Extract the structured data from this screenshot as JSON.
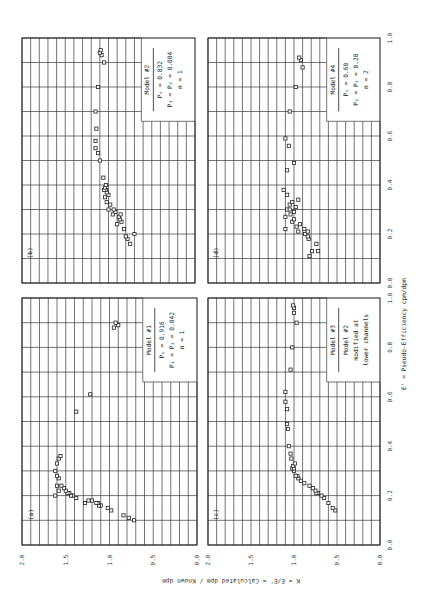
{
  "chart_data": [
    {
      "type": "scatter",
      "panel": "(a)",
      "xlabel": "E' = Pseudo-Efficiency cpm/dpm",
      "ylabel": "K = E/E' = Calculated dpm / Known dpm",
      "xlim": [
        0.0,
        1.0
      ],
      "ylim": [
        0.0,
        2.0
      ],
      "xticks": [
        "0.0",
        "0.2",
        "0.4",
        "0.6",
        "0.8",
        "1.0"
      ],
      "yticks": [
        "0.0",
        "0.5",
        "1.0",
        "1.5",
        "2.0"
      ],
      "grid": true,
      "legend": {
        "title": "Model #1",
        "lines": [
          "P_s = 0.916",
          "P_1 = P_2 = 0.042",
          "n = 1"
        ]
      },
      "points": [
        [
          0.1,
          0.72
        ],
        [
          0.11,
          0.78
        ],
        [
          0.12,
          0.84
        ],
        [
          0.14,
          0.98
        ],
        [
          0.15,
          1.02
        ],
        [
          0.16,
          1.1
        ],
        [
          0.16,
          1.12
        ],
        [
          0.17,
          1.13
        ],
        [
          0.17,
          1.15
        ],
        [
          0.18,
          1.2
        ],
        [
          0.18,
          1.24
        ],
        [
          0.17,
          1.28
        ],
        [
          0.19,
          1.38
        ],
        [
          0.2,
          1.42
        ],
        [
          0.2,
          1.44
        ],
        [
          0.21,
          1.46
        ],
        [
          0.21,
          1.48
        ],
        [
          0.22,
          1.5
        ],
        [
          0.23,
          1.52
        ],
        [
          0.24,
          1.55
        ],
        [
          0.22,
          1.58
        ],
        [
          0.24,
          1.6
        ],
        [
          0.2,
          1.62
        ],
        [
          0.27,
          1.58
        ],
        [
          0.28,
          1.6
        ],
        [
          0.3,
          1.62
        ],
        [
          0.33,
          1.6
        ],
        [
          0.35,
          1.58
        ],
        [
          0.36,
          1.56
        ],
        [
          0.54,
          1.38
        ],
        [
          0.61,
          1.22
        ],
        [
          0.88,
          0.95
        ],
        [
          0.89,
          0.9
        ],
        [
          0.9,
          0.93
        ]
      ]
    },
    {
      "type": "scatter",
      "panel": "(b)",
      "xlim": [
        0.0,
        1.0
      ],
      "ylim": [
        0.0,
        2.0
      ],
      "grid": true,
      "legend": {
        "title": "Model #2",
        "lines": [
          "P_s = 0.832",
          "P_1 = P_2 = 0.084",
          "n = 1"
        ]
      },
      "points": [
        [
          0.16,
          0.75
        ],
        [
          0.18,
          0.78
        ],
        [
          0.19,
          0.8
        ],
        [
          0.2,
          0.7
        ],
        [
          0.22,
          0.82
        ],
        [
          0.24,
          0.9
        ],
        [
          0.25,
          0.85
        ],
        [
          0.26,
          0.87
        ],
        [
          0.27,
          0.88
        ],
        [
          0.28,
          0.86
        ],
        [
          0.28,
          0.95
        ],
        [
          0.29,
          0.92
        ],
        [
          0.3,
          0.94
        ],
        [
          0.3,
          1.0
        ],
        [
          0.32,
          0.98
        ],
        [
          0.33,
          1.02
        ],
        [
          0.35,
          1.04
        ],
        [
          0.36,
          1.0
        ],
        [
          0.37,
          1.02
        ],
        [
          0.38,
          1.03
        ],
        [
          0.38,
          1.05
        ],
        [
          0.39,
          1.04
        ],
        [
          0.4,
          1.03
        ],
        [
          0.43,
          1.06
        ],
        [
          0.5,
          1.1
        ],
        [
          0.53,
          1.12
        ],
        [
          0.55,
          1.15
        ],
        [
          0.58,
          1.15
        ],
        [
          0.63,
          1.14
        ],
        [
          0.7,
          1.15
        ],
        [
          0.8,
          1.12
        ],
        [
          0.9,
          1.05
        ],
        [
          0.93,
          1.08
        ],
        [
          0.94,
          1.1
        ],
        [
          0.95,
          1.09
        ]
      ]
    },
    {
      "type": "scatter",
      "panel": "(c)",
      "xlim": [
        0.0,
        1.0
      ],
      "ylim": [
        0.0,
        2.0
      ],
      "grid": true,
      "legend": {
        "title": "Model #3",
        "lines": [
          "Model #2",
          "modified at",
          "lower channels"
        ]
      },
      "points": [
        [
          0.14,
          0.52
        ],
        [
          0.15,
          0.55
        ],
        [
          0.17,
          0.6
        ],
        [
          0.19,
          0.65
        ],
        [
          0.2,
          0.68
        ],
        [
          0.21,
          0.72
        ],
        [
          0.21,
          0.74
        ],
        [
          0.22,
          0.75
        ],
        [
          0.23,
          0.78
        ],
        [
          0.24,
          0.82
        ],
        [
          0.25,
          0.88
        ],
        [
          0.26,
          0.92
        ],
        [
          0.27,
          0.95
        ],
        [
          0.28,
          0.96
        ],
        [
          0.28,
          0.98
        ],
        [
          0.3,
          1.0
        ],
        [
          0.31,
          1.02
        ],
        [
          0.31,
          1.0
        ],
        [
          0.32,
          1.01
        ],
        [
          0.33,
          0.99
        ],
        [
          0.35,
          1.03
        ],
        [
          0.37,
          1.04
        ],
        [
          0.4,
          1.06
        ],
        [
          0.47,
          1.07
        ],
        [
          0.49,
          1.08
        ],
        [
          0.55,
          1.08
        ],
        [
          0.58,
          1.1
        ],
        [
          0.62,
          1.1
        ],
        [
          0.71,
          1.04
        ],
        [
          0.8,
          1.02
        ],
        [
          0.9,
          0.97
        ],
        [
          0.94,
          1.0
        ],
        [
          0.96,
          1.0
        ],
        [
          0.97,
          1.01
        ]
      ]
    },
    {
      "type": "scatter",
      "panel": "(d)",
      "xlim": [
        0.0,
        1.0
      ],
      "ylim": [
        0.0,
        2.0
      ],
      "grid": true,
      "legend": {
        "title": "Model #4",
        "lines": [
          "P_s = 0.60",
          "P_1 = P_2 = 0.20",
          "n = 2"
        ]
      },
      "points": [
        [
          0.11,
          0.82
        ],
        [
          0.13,
          0.79
        ],
        [
          0.13,
          0.72
        ],
        [
          0.16,
          0.74
        ],
        [
          0.18,
          0.83
        ],
        [
          0.19,
          0.84
        ],
        [
          0.2,
          0.87
        ],
        [
          0.21,
          0.84
        ],
        [
          0.22,
          0.88
        ],
        [
          0.21,
          0.95
        ],
        [
          0.23,
          0.97
        ],
        [
          0.22,
          1.1
        ],
        [
          0.24,
          0.93
        ],
        [
          0.25,
          1.02
        ],
        [
          0.26,
          1.0
        ],
        [
          0.27,
          1.1
        ],
        [
          0.28,
          1.04
        ],
        [
          0.29,
          1.0
        ],
        [
          0.3,
          1.08
        ],
        [
          0.3,
          1.05
        ],
        [
          0.31,
          0.98
        ],
        [
          0.32,
          1.05
        ],
        [
          0.33,
          1.02
        ],
        [
          0.34,
          0.95
        ],
        [
          0.36,
          1.08
        ],
        [
          0.38,
          1.12
        ],
        [
          0.46,
          1.08
        ],
        [
          0.49,
          1.0
        ],
        [
          0.56,
          1.06
        ],
        [
          0.59,
          1.1
        ],
        [
          0.7,
          1.05
        ],
        [
          0.8,
          0.98
        ],
        [
          0.88,
          0.9
        ],
        [
          0.91,
          0.92
        ],
        [
          0.92,
          0.94
        ]
      ]
    }
  ],
  "labels": {
    "panel_a": "(a)",
    "panel_b": "(b)",
    "panel_c": "(c)",
    "panel_d": "(d)",
    "x_axis_title": "E' = Pseudo-Efficiency cpm/dpm",
    "y_axis_title": "K = E/E' = Calculated dpm / Known dpm"
  },
  "ticks": {
    "x": [
      "0.0",
      "0.2",
      "0.4",
      "0.6",
      "0.8",
      "1.0"
    ],
    "y": [
      "0.0",
      "0.5",
      "1.0",
      "1.5",
      "2.0"
    ]
  }
}
